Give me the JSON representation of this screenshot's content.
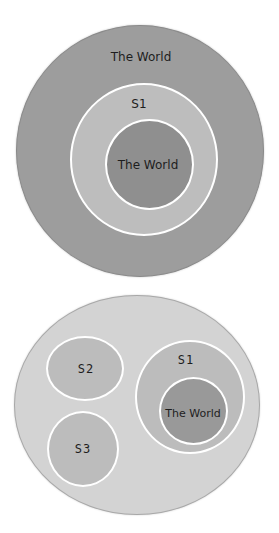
{
  "colors": {
    "background": "#ffffff",
    "top_outer_world": "#9d9d9d",
    "top_outer_border": "#8a8a8a",
    "top_s1": "#bdbdbd",
    "top_inner_world": "#8f8f8f",
    "bottom_outer": "#d3d3d3",
    "bottom_outer_border": "#a8a8a8",
    "subset": "#bcbcbc",
    "bottom_inner_world": "#999999",
    "ring_stroke": "#ffffff",
    "text": "#1e1e1e"
  },
  "diagrams": [
    {
      "id": "world-contains-s1",
      "outer": {
        "label": "The World"
      },
      "children": [
        {
          "label": "S1",
          "children": [
            {
              "label": "The World"
            }
          ]
        }
      ]
    },
    {
      "id": "universe-with-subsets",
      "outer": {
        "label": ""
      },
      "children": [
        {
          "label": "S2"
        },
        {
          "label": "S3"
        },
        {
          "label": "S1",
          "children": [
            {
              "label": "The World"
            }
          ]
        }
      ]
    }
  ]
}
